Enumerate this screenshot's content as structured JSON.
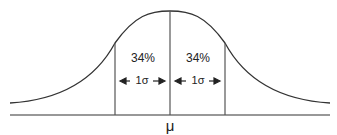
{
  "diagram": {
    "type": "normal-distribution",
    "mean_label": "μ",
    "regions": [
      {
        "side": "left",
        "percent_label": "34%",
        "width_label": "1σ"
      },
      {
        "side": "right",
        "percent_label": "34%",
        "width_label": "1σ"
      }
    ],
    "colors": {
      "curve": "#333333",
      "lines": "#555555",
      "baseline": "#333333"
    }
  }
}
